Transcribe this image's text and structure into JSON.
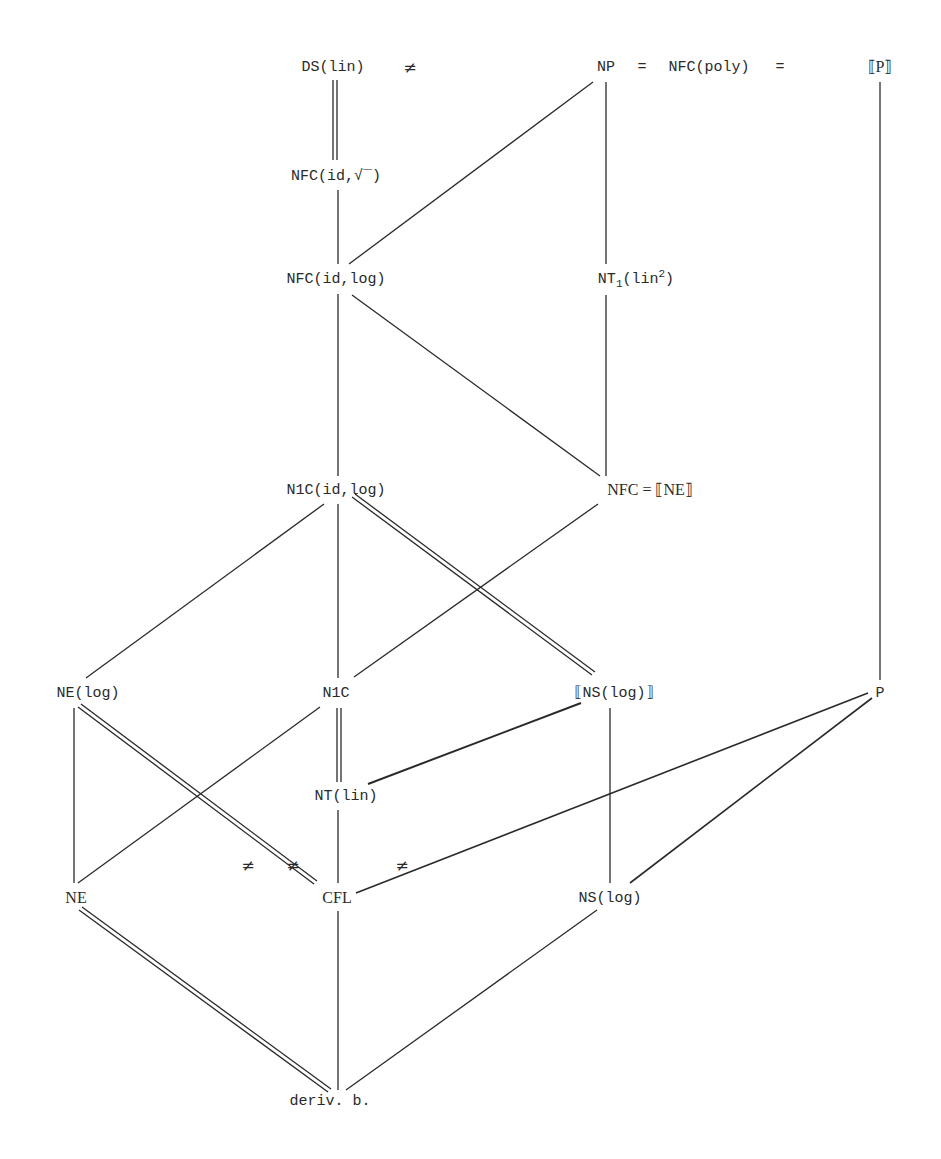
{
  "page": {
    "number": "33"
  },
  "nodes": {
    "ds_lin": "DS(lin)",
    "np": "NP",
    "eq1": "=",
    "nfc_poly": "NFC(poly)",
    "eq2": "=",
    "bracket_p": "⟦P⟧",
    "nfc_id_sqrt_prefix": "NFC(id,",
    "nfc_id_sqrt_sym": "√‾",
    "nfc_id_sqrt_suffix": ")",
    "nfc_id_log": "NFC(id,log)",
    "nt1_base": "NT",
    "nt1_sub": "1",
    "nt1_arg": "(lin",
    "nt1_sup": "2",
    "nt1_close": ")",
    "n1c_id_log": "N1C(id,log)",
    "nfc_eq_ne": "NFC  =  ⟦NE⟧",
    "ne_log": "NE(log)",
    "n1c": "N1C",
    "bracket_ns_log": "⟦NS(log)⟧",
    "p": "P",
    "nt_lin": "NT(lin)",
    "ne": "NE",
    "cfl": "CFL",
    "ns_log": "NS(log)",
    "deriv_b": "deriv. b."
  },
  "relations": {
    "neq_top": "≠",
    "neq_1": "≠",
    "neq_2": "≠",
    "neq_3": "≠"
  },
  "edges": [
    {
      "from": "DS(lin)",
      "to": "NFC(id,√)",
      "type": "double"
    },
    {
      "from": "NFC(id,√)",
      "to": "NFC(id,log)",
      "type": "single"
    },
    {
      "from": "NP",
      "to": "NFC(id,log)",
      "type": "single"
    },
    {
      "from": "NP",
      "to": "NT1(lin2)",
      "type": "single"
    },
    {
      "from": "[P]",
      "to": "P",
      "type": "single"
    },
    {
      "from": "NFC(id,log)",
      "to": "N1C(id,log)",
      "type": "single"
    },
    {
      "from": "NFC(id,log)",
      "to": "NFC",
      "type": "single"
    },
    {
      "from": "NT1(lin2)",
      "to": "NFC",
      "type": "single"
    },
    {
      "from": "N1C(id,log)",
      "to": "NE(log)",
      "type": "single"
    },
    {
      "from": "N1C(id,log)",
      "to": "N1C",
      "type": "single"
    },
    {
      "from": "N1C(id,log)",
      "to": "[NS(log)]",
      "type": "double"
    },
    {
      "from": "NFC",
      "to": "N1C",
      "type": "single"
    },
    {
      "from": "N1C",
      "to": "NT(lin)",
      "type": "double"
    },
    {
      "from": "N1C",
      "to": "NE",
      "type": "single"
    },
    {
      "from": "[NS(log)]",
      "to": "NT(lin)",
      "type": "single"
    },
    {
      "from": "[NS(log)]",
      "to": "NS(log)",
      "type": "single"
    },
    {
      "from": "NE(log)",
      "to": "NE",
      "type": "single"
    },
    {
      "from": "NE(log)",
      "to": "CFL",
      "type": "double"
    },
    {
      "from": "NT(lin)",
      "to": "CFL",
      "type": "single"
    },
    {
      "from": "P",
      "to": "CFL",
      "type": "single"
    },
    {
      "from": "P",
      "to": "NS(log)",
      "type": "single"
    },
    {
      "from": "NE",
      "to": "deriv. b.",
      "type": "double"
    },
    {
      "from": "CFL",
      "to": "deriv. b.",
      "type": "single"
    },
    {
      "from": "NS(log)",
      "to": "deriv. b.",
      "type": "single"
    }
  ]
}
